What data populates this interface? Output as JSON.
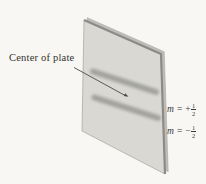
{
  "figure": {
    "background": "#f8f7f4",
    "colors": {
      "plate_fill": "#d9d8d3",
      "plate_side": "#bebdb9",
      "plate_edge_dark": "#8b8b89",
      "plate_outline": "#a3a29e",
      "fringe": "#9c9c99",
      "leader": "#4a4945",
      "text": "#33312c"
    },
    "labels": {
      "center_of_plate": "Center of plate",
      "orders": [
        {
          "variable": "m",
          "equals": "=",
          "sign": "+",
          "numerator": "1",
          "denominator": "2"
        },
        {
          "variable": "m",
          "equals": "=",
          "sign": "−",
          "numerator": "1",
          "denominator": "2"
        }
      ]
    }
  }
}
